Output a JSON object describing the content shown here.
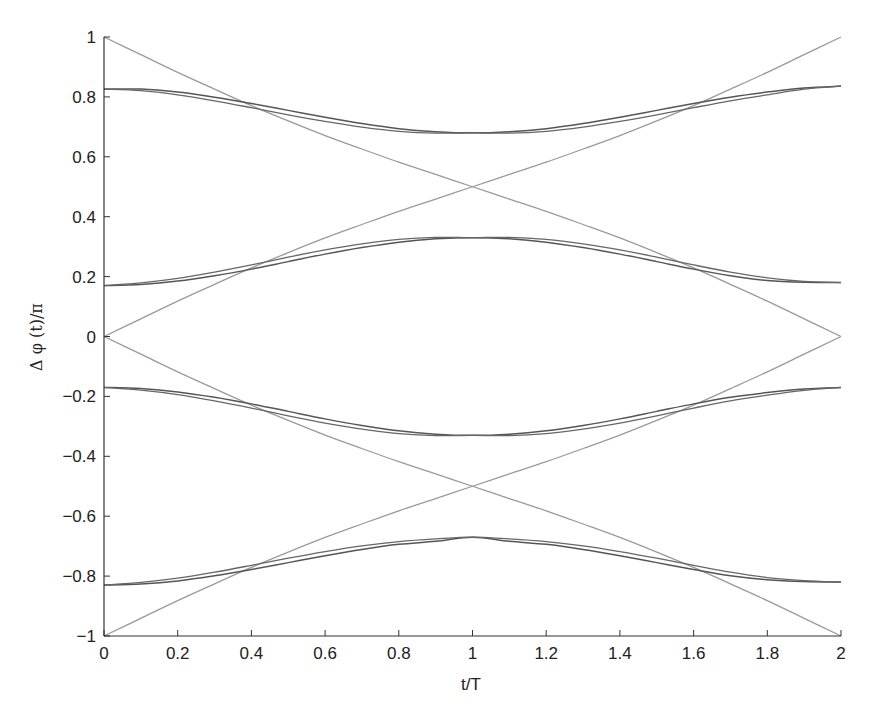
{
  "chart_data": {
    "type": "line",
    "title": "",
    "xlabel": "t/T",
    "ylabel": "Δ φ (t)/π",
    "xlim": [
      0,
      2
    ],
    "ylim": [
      -1,
      1
    ],
    "grid": false,
    "legend": null,
    "x_ticks": [
      "0",
      "0.2",
      "0.4",
      "0.6",
      "0.8",
      "1",
      "1.2",
      "1.4",
      "1.6",
      "1.8",
      "2"
    ],
    "y_ticks": [
      "−1",
      "−0.8",
      "−0.6",
      "−0.4",
      "−0.2",
      "0",
      "0.2",
      "0.4",
      "0.6",
      "0.8",
      "1"
    ],
    "x": [
      0,
      0.1,
      0.2,
      0.3,
      0.4,
      0.5,
      0.6,
      0.7,
      0.8,
      0.9,
      1.0,
      1.1,
      1.2,
      1.3,
      1.4,
      1.5,
      1.6,
      1.7,
      1.8,
      1.9,
      2.0
    ],
    "series": [
      {
        "name": "light-falling-upper",
        "color": "#9a9a9a",
        "width": 1.3,
        "values": [
          1.0,
          0.941,
          0.882,
          0.826,
          0.771,
          0.72,
          0.671,
          0.626,
          0.582,
          0.541,
          0.5,
          0.459,
          0.418,
          0.374,
          0.329,
          0.28,
          0.229,
          0.174,
          0.118,
          0.059,
          0.0
        ]
      },
      {
        "name": "light-rising-upper",
        "color": "#9a9a9a",
        "width": 1.3,
        "values": [
          0.0,
          0.059,
          0.118,
          0.174,
          0.229,
          0.28,
          0.329,
          0.374,
          0.418,
          0.459,
          0.5,
          0.541,
          0.582,
          0.626,
          0.671,
          0.72,
          0.771,
          0.826,
          0.882,
          0.941,
          1.0
        ]
      },
      {
        "name": "light-falling-lower",
        "color": "#9a9a9a",
        "width": 1.3,
        "values": [
          0.0,
          -0.059,
          -0.118,
          -0.174,
          -0.229,
          -0.28,
          -0.329,
          -0.374,
          -0.418,
          -0.459,
          -0.5,
          -0.541,
          -0.582,
          -0.626,
          -0.671,
          -0.72,
          -0.771,
          -0.826,
          -0.882,
          -0.941,
          -1.0
        ]
      },
      {
        "name": "light-rising-lower",
        "color": "#9a9a9a",
        "width": 1.3,
        "values": [
          -1.0,
          -0.941,
          -0.882,
          -0.826,
          -0.771,
          -0.72,
          -0.671,
          -0.626,
          -0.582,
          -0.541,
          -0.5,
          -0.459,
          -0.418,
          -0.374,
          -0.329,
          -0.28,
          -0.229,
          -0.174,
          -0.118,
          -0.059,
          0.0
        ]
      },
      {
        "name": "dark-outer-upper-a",
        "color": "#555555",
        "width": 1.5,
        "values": [
          0.826,
          0.826,
          0.816,
          0.799,
          0.778,
          0.755,
          0.732,
          0.711,
          0.694,
          0.684,
          0.68,
          0.684,
          0.694,
          0.711,
          0.732,
          0.755,
          0.778,
          0.799,
          0.816,
          0.83,
          0.836
        ]
      },
      {
        "name": "dark-outer-upper-b",
        "color": "#666666",
        "width": 1.3,
        "values": [
          0.826,
          0.821,
          0.807,
          0.787,
          0.764,
          0.74,
          0.718,
          0.699,
          0.685,
          0.679,
          0.68,
          0.679,
          0.685,
          0.699,
          0.718,
          0.74,
          0.764,
          0.787,
          0.807,
          0.826,
          0.836
        ]
      },
      {
        "name": "dark-inner-upper-a",
        "color": "#555555",
        "width": 1.5,
        "values": [
          0.17,
          0.174,
          0.185,
          0.203,
          0.225,
          0.25,
          0.275,
          0.297,
          0.315,
          0.326,
          0.33,
          0.326,
          0.315,
          0.297,
          0.275,
          0.25,
          0.225,
          0.203,
          0.187,
          0.181,
          0.18
        ]
      },
      {
        "name": "dark-inner-upper-b",
        "color": "#666666",
        "width": 1.3,
        "values": [
          0.17,
          0.179,
          0.194,
          0.215,
          0.239,
          0.265,
          0.289,
          0.309,
          0.324,
          0.331,
          0.33,
          0.331,
          0.324,
          0.309,
          0.289,
          0.265,
          0.239,
          0.215,
          0.196,
          0.184,
          0.18
        ]
      },
      {
        "name": "dark-inner-lower-a",
        "color": "#555555",
        "width": 1.5,
        "values": [
          -0.17,
          -0.174,
          -0.185,
          -0.203,
          -0.225,
          -0.25,
          -0.275,
          -0.297,
          -0.315,
          -0.326,
          -0.33,
          -0.326,
          -0.315,
          -0.297,
          -0.275,
          -0.25,
          -0.225,
          -0.203,
          -0.187,
          -0.175,
          -0.17
        ]
      },
      {
        "name": "dark-inner-lower-b",
        "color": "#666666",
        "width": 1.3,
        "values": [
          -0.17,
          -0.179,
          -0.194,
          -0.215,
          -0.239,
          -0.265,
          -0.289,
          -0.309,
          -0.324,
          -0.331,
          -0.33,
          -0.331,
          -0.324,
          -0.309,
          -0.289,
          -0.265,
          -0.239,
          -0.215,
          -0.196,
          -0.18,
          -0.17
        ]
      },
      {
        "name": "dark-outer-lower-a",
        "color": "#555555",
        "width": 1.5,
        "values": [
          -0.83,
          -0.826,
          -0.816,
          -0.799,
          -0.778,
          -0.755,
          -0.732,
          -0.711,
          -0.694,
          -0.684,
          -0.67,
          -0.684,
          -0.694,
          -0.711,
          -0.732,
          -0.755,
          -0.778,
          -0.799,
          -0.812,
          -0.818,
          -0.82
        ]
      },
      {
        "name": "dark-outer-lower-b",
        "color": "#666666",
        "width": 1.3,
        "values": [
          -0.83,
          -0.821,
          -0.807,
          -0.787,
          -0.764,
          -0.74,
          -0.718,
          -0.699,
          -0.685,
          -0.676,
          -0.67,
          -0.676,
          -0.685,
          -0.699,
          -0.718,
          -0.74,
          -0.764,
          -0.787,
          -0.805,
          -0.815,
          -0.82
        ]
      }
    ]
  },
  "layout": {
    "plot_left": 104,
    "plot_right": 841,
    "plot_top": 37,
    "plot_bottom": 636,
    "axis_color": "#333333"
  }
}
